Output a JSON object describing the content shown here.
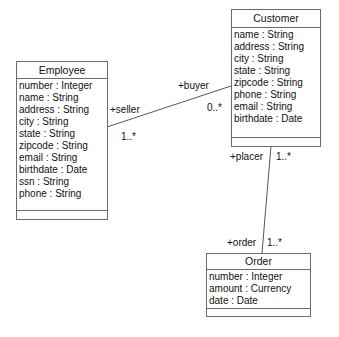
{
  "classes": {
    "customer": {
      "name": "Customer",
      "attributes": [
        "name : String",
        "address : String",
        "city : String",
        "state : String",
        "zipcode : String",
        "phone : String",
        "email : String",
        "birthdate : Date"
      ]
    },
    "employee": {
      "name": "Employee",
      "attributes": [
        "number : Integer",
        "name : String",
        "address : String",
        "city : String",
        "state : String",
        "zipcode : String",
        "email : String",
        "birthdate : Date",
        "ssn : String",
        "phone : String"
      ]
    },
    "order": {
      "name": "Order",
      "attributes": [
        "number : Integer",
        "amount : Currency",
        "date : Date"
      ]
    }
  },
  "associations": {
    "employee_customer": {
      "seller_role": "+seller",
      "seller_mult": "1..*",
      "buyer_role": "+buyer",
      "buyer_mult": "0..*"
    },
    "customer_order": {
      "placer_role": "+placer",
      "placer_mult": "1..*",
      "order_role": "+order",
      "order_mult": "1..*"
    }
  },
  "colors": {
    "border": "#6b6b6b",
    "line": "#555555",
    "text": "#111111"
  }
}
